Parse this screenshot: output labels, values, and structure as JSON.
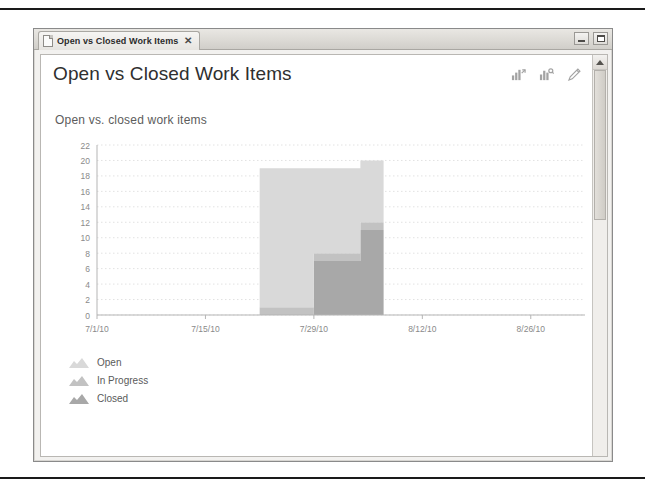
{
  "window": {
    "tab": {
      "label": "Open vs Closed Work Items",
      "close_label": "✕",
      "doc_icon": "document-icon"
    },
    "controls": {
      "minimize_label": "Minimize",
      "maximize_label": "Maximize"
    }
  },
  "header": {
    "title": "Open vs Closed Work Items",
    "toolbar": [
      {
        "name": "export-chart-icon",
        "label": "Export chart"
      },
      {
        "name": "chart-options-icon",
        "label": "Chart options"
      },
      {
        "name": "edit-pencil-icon",
        "label": "Edit"
      }
    ]
  },
  "colors": {
    "open": "#d9d9d9",
    "in_progress": "#c2c2c2",
    "closed": "#a8a8a8",
    "grid": "#e2e2e2",
    "axis": "#b5b5b5",
    "tick_text": "#8a8a8a"
  },
  "chart_data": {
    "type": "area",
    "title": "Open vs. closed work items",
    "xlabel": "",
    "ylabel": "",
    "ylim": [
      0,
      22
    ],
    "yticks": [
      0,
      2,
      4,
      6,
      8,
      10,
      12,
      14,
      16,
      18,
      20,
      22
    ],
    "grid": true,
    "legend_position": "bottom-left",
    "stacked": true,
    "x_tick_labels": [
      "7/1/10",
      "7/15/10",
      "7/29/10",
      "8/12/10",
      "8/26/10"
    ],
    "x_domain": [
      "7/1/10",
      "9/2/10"
    ],
    "x": [
      "7/22/10",
      "7/25/10",
      "7/29/10",
      "8/1/10",
      "8/4/10",
      "8/7/10"
    ],
    "series": [
      {
        "name": "Closed",
        "values": [
          0,
          0,
          7,
          7,
          11,
          11
        ]
      },
      {
        "name": "In Progress",
        "values": [
          1,
          1,
          1,
          1,
          1,
          1
        ]
      },
      {
        "name": "Open",
        "values": [
          18,
          18,
          11,
          11,
          8,
          8
        ]
      }
    ],
    "totals": [
      19,
      19,
      19,
      19,
      20,
      20
    ]
  },
  "legend": [
    {
      "label": "Open",
      "swatch": "open"
    },
    {
      "label": "In Progress",
      "swatch": "in_progress"
    },
    {
      "label": "Closed",
      "swatch": "closed"
    }
  ],
  "scrollbar": {
    "up_arrow": "chevron-up-icon"
  }
}
